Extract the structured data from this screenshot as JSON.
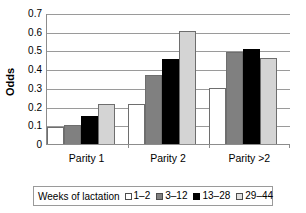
{
  "chart_data": {
    "type": "bar",
    "title": "",
    "xlabel": "",
    "ylabel": "Odds",
    "ylim": [
      0,
      0.7
    ],
    "ytick_values": [
      0,
      0.1,
      0.2,
      0.3,
      0.4,
      0.5,
      0.6,
      0.7
    ],
    "ytick_labels": [
      "0",
      "0.1",
      "0.2",
      "0.3",
      "0.4",
      "0.5",
      "0.6",
      "0.7"
    ],
    "grid": true,
    "legend_position": "bottom",
    "legend_title": "Weeks of lactation",
    "categories": [
      "Parity 1",
      "Parity 2",
      "Parity >2"
    ],
    "series": [
      {
        "name": "1–2",
        "color": "#ffffff",
        "values": [
          0.09,
          0.213,
          0.3
        ]
      },
      {
        "name": "3–12",
        "color": "#808080",
        "values": [
          0.1,
          0.368,
          0.49
        ]
      },
      {
        "name": "13–28",
        "color": "#000000",
        "values": [
          0.15,
          0.455,
          0.51
        ]
      },
      {
        "name": "29–44",
        "color": "#d4d4d4",
        "values": [
          0.215,
          0.605,
          0.46
        ]
      }
    ]
  }
}
